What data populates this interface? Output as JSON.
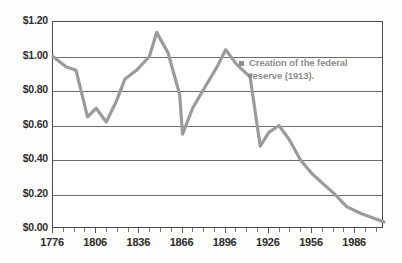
{
  "chart_data": {
    "type": "line",
    "title": "",
    "xlabel": "",
    "ylabel": "",
    "xlim": [
      1776,
      2006
    ],
    "ylim": [
      0.0,
      1.2
    ],
    "grid": true,
    "legend": false,
    "y_ticks": [
      0.0,
      0.2,
      0.4,
      0.6,
      0.8,
      1.0,
      1.2
    ],
    "y_tick_labels": [
      "$0.00",
      "$0.20",
      "$0.40",
      "$0.60",
      "$0.80",
      "$1.00",
      "$1.20"
    ],
    "x_ticks": [
      1776,
      1806,
      1836,
      1866,
      1896,
      1926,
      1956,
      1986
    ],
    "x_tick_labels": [
      "1776",
      "1806",
      "1836",
      "1866",
      "1896",
      "1926",
      "1956",
      "1986"
    ],
    "x_minor_tick_step": 7.5,
    "series": [
      {
        "name": "Purchasing power of the U.S. dollar",
        "color": "#9b9b9b",
        "line_width": 3.2,
        "x": [
          1776,
          1785,
          1792,
          1800,
          1806,
          1813,
          1820,
          1826,
          1834,
          1843,
          1848,
          1856,
          1864,
          1866,
          1873,
          1880,
          1890,
          1896,
          1903,
          1913,
          1920,
          1926,
          1933,
          1940,
          1948,
          1956,
          1964,
          1972,
          1980,
          1990,
          2000,
          2006
        ],
        "y": [
          1.0,
          0.94,
          0.92,
          0.65,
          0.7,
          0.62,
          0.74,
          0.87,
          0.92,
          1.0,
          1.14,
          1.02,
          0.78,
          0.55,
          0.7,
          0.8,
          0.94,
          1.04,
          0.96,
          0.88,
          0.48,
          0.56,
          0.6,
          0.52,
          0.4,
          0.32,
          0.26,
          0.2,
          0.13,
          0.09,
          0.06,
          0.04
        ]
      }
    ],
    "annotations": [
      {
        "text": "Creation of the federal reserve (1913).",
        "marker_x": 1913,
        "marker_y": 0.89,
        "color": "#8d8d8d"
      }
    ]
  },
  "annotation": {
    "line1": "Creation of the federal",
    "line2": "reserve (1913)."
  },
  "colors": {
    "series": "#9b9b9b",
    "grid": "#6d6d6d",
    "frame": "#4a4a4a",
    "axis_text": "#2b2b2b",
    "annotation_text": "#8d8d8d",
    "background": "#ffffff"
  }
}
